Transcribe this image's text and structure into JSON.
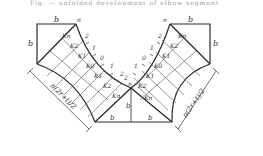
{
  "caption": "Fig. — unfolded development of elbow segment",
  "labels": {
    "b": "b",
    "n": "n",
    "arc_length": "π(2r+t)/2",
    "k_left_top": [
      "Kn",
      "K2",
      "K1",
      "K0",
      "K1",
      "K2",
      "Kn"
    ],
    "k_right": [
      "Kn",
      "K2",
      "K1",
      "K0",
      "K1",
      "K2",
      "Kn"
    ],
    "ticks_left": [
      "2",
      "1",
      "0",
      "1",
      "2"
    ],
    "ticks_right": [
      "2",
      "1",
      "0",
      "1",
      "2"
    ]
  },
  "colors": {
    "line": "#2a2a2a",
    "thin": "#555555",
    "bg": "#ffffff"
  }
}
